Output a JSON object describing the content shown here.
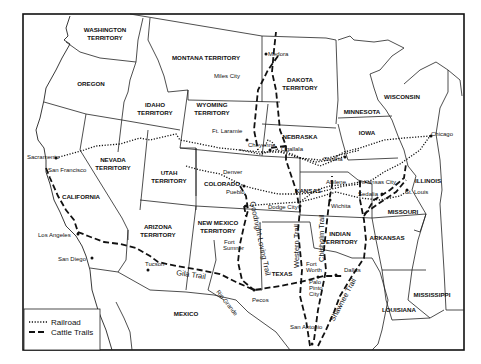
{
  "map": {
    "regions": [
      {
        "id": "washington",
        "line1": "WASHINGTON",
        "line2": "TERRITORY"
      },
      {
        "id": "oregon",
        "line1": "OREGON",
        "line2": ""
      },
      {
        "id": "montana",
        "line1": "MONTANA TERRITORY",
        "line2": ""
      },
      {
        "id": "idaho",
        "line1": "IDAHO",
        "line2": "TERRITORY"
      },
      {
        "id": "wyoming",
        "line1": "WYOMING",
        "line2": "TERRITORY"
      },
      {
        "id": "dakota",
        "line1": "DAKOTA",
        "line2": "TERRITORY"
      },
      {
        "id": "minnesota",
        "line1": "MINNESOTA",
        "line2": ""
      },
      {
        "id": "wisconsin",
        "line1": "WISCONSIN",
        "line2": ""
      },
      {
        "id": "iowa",
        "line1": "IOWA",
        "line2": ""
      },
      {
        "id": "nebraska",
        "line1": "NEBRASKA",
        "line2": ""
      },
      {
        "id": "nevada",
        "line1": "NEVADA",
        "line2": "TERRITORY"
      },
      {
        "id": "utah",
        "line1": "UTAH",
        "line2": "TERRITORY"
      },
      {
        "id": "colorado",
        "line1": "COLORADO",
        "line2": ""
      },
      {
        "id": "california",
        "line1": "CALIFORNIA",
        "line2": ""
      },
      {
        "id": "kansas",
        "line1": "KANSAS",
        "line2": ""
      },
      {
        "id": "illinois",
        "line1": "ILLINOIS",
        "line2": ""
      },
      {
        "id": "missouri",
        "line1": "MISSOURI",
        "line2": ""
      },
      {
        "id": "arizona",
        "line1": "ARIZONA",
        "line2": "TERRITORY"
      },
      {
        "id": "new_mexico",
        "line1": "NEW MEXICO",
        "line2": "TERRITORY"
      },
      {
        "id": "indian",
        "line1": "INDIAN",
        "line2": "TERRITORY"
      },
      {
        "id": "arkansas",
        "line1": "ARKANSAS",
        "line2": ""
      },
      {
        "id": "texas",
        "line1": "TEXAS",
        "line2": ""
      },
      {
        "id": "mississippi",
        "line1": "MISSISSIPPI",
        "line2": ""
      },
      {
        "id": "louisiana",
        "line1": "LOUISIANA",
        "line2": ""
      },
      {
        "id": "mexico",
        "line1": "MEXICO",
        "line2": ""
      }
    ],
    "cities": [
      {
        "name": "Medora"
      },
      {
        "name": "Miles City"
      },
      {
        "name": "Ft. Laramie"
      },
      {
        "name": "Cheyenne"
      },
      {
        "name": "Ogallala"
      },
      {
        "name": "Omaha"
      },
      {
        "name": "Chicago"
      },
      {
        "name": "Sacramento"
      },
      {
        "name": "San Francisco"
      },
      {
        "name": "Denver"
      },
      {
        "name": "Pueblo"
      },
      {
        "name": "Abilene"
      },
      {
        "name": "Kansas City"
      },
      {
        "name": "Sedalia"
      },
      {
        "name": "St. Louis"
      },
      {
        "name": "Wichita"
      },
      {
        "name": "Dodge City"
      },
      {
        "name": "Los Angeles"
      },
      {
        "name": "San Diego"
      },
      {
        "name": "Tucson"
      },
      {
        "name": "Fort"
      },
      {
        "name": "Sumner"
      },
      {
        "name": "Pecos"
      },
      {
        "name": "Fort"
      },
      {
        "name": "Worth"
      },
      {
        "name": "Palo"
      },
      {
        "name": "Pinto"
      },
      {
        "name": "City"
      },
      {
        "name": "Dallas"
      },
      {
        "name": "San Antonio"
      }
    ],
    "trails": [
      {
        "name": "Gila Trail"
      },
      {
        "name": "Goodnight-Loving Trail"
      },
      {
        "name": "Western Trail"
      },
      {
        "name": "Chisholm Trail"
      },
      {
        "name": "Shawnee Trail"
      },
      {
        "name": "Rio Grande"
      }
    ],
    "legend": {
      "railroad_label": "Railroad",
      "cattle_trails_label": "Cattle Trails"
    }
  }
}
